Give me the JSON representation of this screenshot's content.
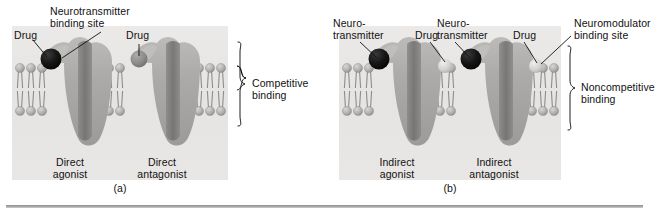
{
  "figure": {
    "panels": [
      {
        "tag": "(a)",
        "binding_label": "Competitive\nbinding",
        "callouts": [
          {
            "name": "drug-left",
            "text": "Drug"
          },
          {
            "name": "neurotransmitter-binding-site",
            "text": "Neurotransmitter\nbinding site"
          },
          {
            "name": "drug-right",
            "text": "Drug"
          }
        ],
        "receptors": [
          {
            "name": "direct-agonist",
            "text": "Direct\nagonist"
          },
          {
            "name": "direct-antagonist",
            "text": "Direct\nantagonist"
          }
        ]
      },
      {
        "tag": "(b)",
        "binding_label": "Noncompetitive\nbinding",
        "callouts": [
          {
            "name": "neurotransmitter-left",
            "text": "Neuro-\ntransmitter"
          },
          {
            "name": "drug-left",
            "text": "Drug"
          },
          {
            "name": "neurotransmitter-right",
            "text": "Neuro-\ntransmitter"
          },
          {
            "name": "drug-right",
            "text": "Drug"
          },
          {
            "name": "neuromodulator-binding-site",
            "text": "Neuromodulator\nbinding site"
          }
        ],
        "receptors": [
          {
            "name": "indirect-agonist",
            "text": "Indirect\nagonist"
          },
          {
            "name": "indirect-antagonist",
            "text": "Indirect\nantagonist"
          }
        ]
      }
    ],
    "colors": {
      "ligand_dark": "#141414",
      "ligand_gray": "#8e8e8e",
      "ligand_light": "#d8d6d4",
      "receptor": "#a9a7a5",
      "membrane_head": "#b7b5b3",
      "plate_background": "#e9e7e5",
      "rule": "#8f8f8f",
      "text": "#111111"
    }
  }
}
